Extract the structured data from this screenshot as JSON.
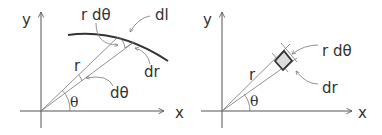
{
  "diagrams": [
    {
      "id": "arc-length",
      "axis_labels": {
        "x": "x",
        "y": "y"
      },
      "labels": {
        "r": "r",
        "theta": "θ",
        "r_dtheta": "r dθ",
        "dl": "dl",
        "dr": "dr",
        "dtheta": "dθ"
      }
    },
    {
      "id": "area-element",
      "axis_labels": {
        "x": "x",
        "y": "y"
      },
      "labels": {
        "r": "r",
        "theta": "θ",
        "r_dtheta": "r dθ",
        "dr": "dr"
      }
    }
  ],
  "colors": {
    "ink": "#333333",
    "area_fill": "#dcdcdc"
  }
}
